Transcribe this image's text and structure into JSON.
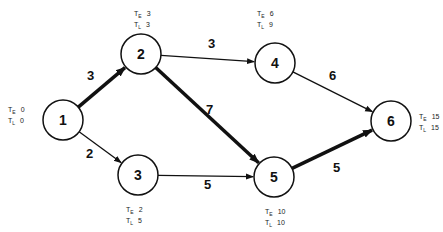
{
  "diagram": {
    "type": "network",
    "nodes": [
      {
        "id": "1",
        "label": "1",
        "cx": 63,
        "cy": 120,
        "te": "0",
        "tl": "0",
        "tx": 8,
        "ty": 106
      },
      {
        "id": "2",
        "label": "2",
        "cx": 141,
        "cy": 54,
        "te": "3",
        "tl": "3",
        "tx": 134,
        "ty": 10
      },
      {
        "id": "3",
        "label": "3",
        "cx": 138,
        "cy": 175,
        "te": "2",
        "tl": "5",
        "tx": 126,
        "ty": 206
      },
      {
        "id": "4",
        "label": "4",
        "cx": 275,
        "cy": 63,
        "te": "6",
        "tl": "9",
        "tx": 257,
        "ty": 10
      },
      {
        "id": "5",
        "label": "5",
        "cx": 274,
        "cy": 177,
        "te": "10",
        "tl": "10",
        "tx": 265,
        "ty": 208
      },
      {
        "id": "6",
        "label": "6",
        "cx": 391,
        "cy": 121,
        "te": "15",
        "tl": "15",
        "tx": 419,
        "ty": 113
      }
    ],
    "edges": [
      {
        "from": "1",
        "to": "2",
        "weight": "3",
        "critical": true,
        "lx": 87,
        "ly": 80
      },
      {
        "from": "1",
        "to": "3",
        "weight": "2",
        "critical": false,
        "lx": 86,
        "ly": 158
      },
      {
        "from": "2",
        "to": "4",
        "weight": "3",
        "critical": false,
        "lx": 208,
        "ly": 48
      },
      {
        "from": "2",
        "to": "5",
        "weight": "7",
        "critical": true,
        "lx": 206,
        "ly": 114
      },
      {
        "from": "3",
        "to": "5",
        "weight": "5",
        "critical": false,
        "lx": 204,
        "ly": 189
      },
      {
        "from": "4",
        "to": "6",
        "weight": "6",
        "critical": false,
        "lx": 329,
        "ly": 80
      },
      {
        "from": "5",
        "to": "6",
        "weight": "5",
        "critical": true,
        "lx": 333,
        "ly": 172
      }
    ],
    "time_labels": {
      "early": "T",
      "early_sub": "E",
      "late": "T",
      "late_sub": "L"
    }
  }
}
